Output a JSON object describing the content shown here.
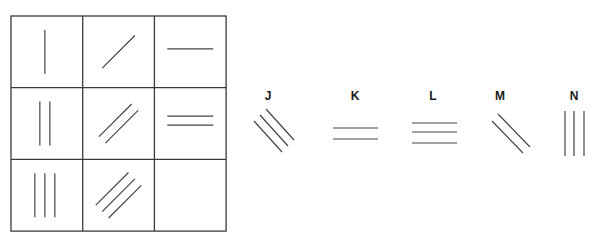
{
  "puzzle": {
    "type": "matrix-completion",
    "grid": {
      "rows": 3,
      "cols": 3,
      "left": 11,
      "top": 16,
      "cell_size": 71.7,
      "border_color": "#3a3a3a",
      "cells": [
        {
          "row": 0,
          "col": 0,
          "orientation": "vertical",
          "count": 1
        },
        {
          "row": 0,
          "col": 1,
          "orientation": "diagonal-up",
          "count": 1
        },
        {
          "row": 0,
          "col": 2,
          "orientation": "horizontal",
          "count": 1
        },
        {
          "row": 1,
          "col": 0,
          "orientation": "vertical",
          "count": 2
        },
        {
          "row": 1,
          "col": 1,
          "orientation": "diagonal-up",
          "count": 2
        },
        {
          "row": 1,
          "col": 2,
          "orientation": "horizontal",
          "count": 2
        },
        {
          "row": 2,
          "col": 0,
          "orientation": "vertical",
          "count": 3
        },
        {
          "row": 2,
          "col": 1,
          "orientation": "diagonal-up",
          "count": 3
        },
        {
          "row": 2,
          "col": 2,
          "orientation": "empty",
          "count": 0
        }
      ]
    },
    "line_color": "#444444",
    "options": [
      {
        "label": "J",
        "cx": 268,
        "label_y": 90,
        "orientation": "diagonal-down",
        "count": 3,
        "lines": [
          [
            254,
            121,
            282,
            152
          ],
          [
            260,
            115,
            288,
            146
          ],
          [
            266,
            109,
            294,
            140
          ]
        ]
      },
      {
        "label": "K",
        "cx": 355,
        "label_y": 90,
        "orientation": "horizontal",
        "count": 2,
        "lines": [
          [
            333,
            128,
            378,
            128
          ],
          [
            333,
            139,
            378,
            139
          ]
        ]
      },
      {
        "label": "L",
        "cx": 433,
        "label_y": 90,
        "orientation": "horizontal",
        "count": 3,
        "lines": [
          [
            412,
            123,
            457,
            123
          ],
          [
            412,
            132,
            457,
            132
          ],
          [
            412,
            143,
            457,
            143
          ]
        ]
      },
      {
        "label": "M",
        "cx": 500,
        "label_y": 90,
        "orientation": "diagonal-down",
        "count": 2,
        "lines": [
          [
            492,
            121,
            523,
            153
          ],
          [
            498,
            114,
            530,
            147
          ]
        ]
      },
      {
        "label": "N",
        "cx": 574,
        "label_y": 90,
        "orientation": "vertical",
        "count": 3,
        "lines": [
          [
            565,
            111,
            565,
            156
          ],
          [
            574,
            111,
            574,
            156
          ],
          [
            584,
            111,
            584,
            156
          ]
        ]
      }
    ]
  }
}
